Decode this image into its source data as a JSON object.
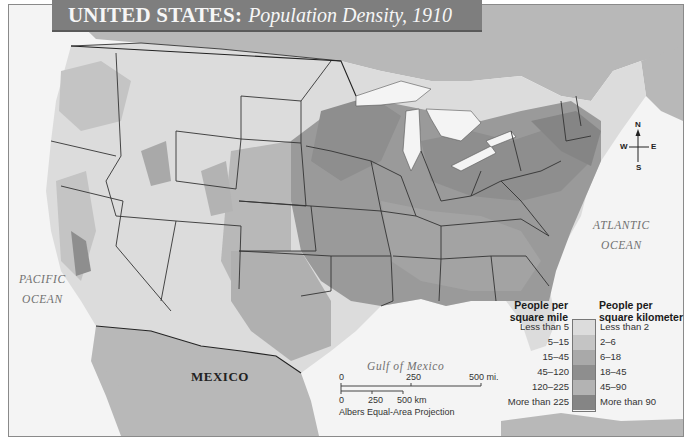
{
  "title": {
    "main": "UNITED STATES:",
    "sub": "Population Density, 1910"
  },
  "labels": {
    "canada": "CANADA",
    "mexico": "MEXICO",
    "pacific_line1": "PACIFIC",
    "pacific_line2": "OCEAN",
    "atlantic_line1": "ATLANTIC",
    "atlantic_line2": "OCEAN",
    "gulf": "Gulf of Mexico"
  },
  "compass": {
    "n": "N",
    "s": "S",
    "e": "E",
    "w": "W",
    "icon": "compass-rose-icon"
  },
  "scale_bar": {
    "miles": [
      "0",
      "250",
      "500 mi."
    ],
    "km": [
      "0",
      "250",
      "500 km"
    ],
    "projection": "Albers Equal-Area Projection"
  },
  "legend": {
    "left_header_line1": "People per",
    "left_header_line2": "square mile",
    "right_header_line1": "People per",
    "right_header_line2": "square kilometer",
    "classes": [
      {
        "per_mile": "Less than 5",
        "per_km": "Less than 2",
        "color": "#dcdcdc"
      },
      {
        "per_mile": "5–15",
        "per_km": "2–6",
        "color": "#c4c4c4"
      },
      {
        "per_mile": "15–45",
        "per_km": "6–18",
        "color": "#a9a9a9"
      },
      {
        "per_mile": "45–120",
        "per_km": "18–45",
        "color": "#8e8e8e"
      },
      {
        "per_mile": "120–225",
        "per_km": "45–90",
        "color": "#b3b3b3"
      },
      {
        "per_mile": "More than 225",
        "per_km": "More than 90",
        "color": "#858585"
      }
    ]
  },
  "colors": {
    "water": "#f4f4f4",
    "foreign_land": "#b8b8b8",
    "title_bar": "#7e7e7e",
    "border_line": "#333333"
  }
}
